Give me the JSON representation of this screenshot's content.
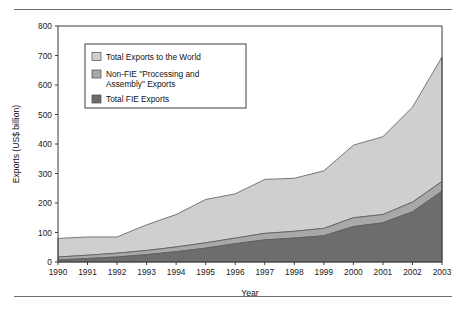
{
  "figure": {
    "top_rule": "horizontal-rule",
    "bottom_rule": "horizontal-rule"
  },
  "chart_data": {
    "type": "area",
    "stacked": true,
    "title": "",
    "xlabel": "Year",
    "ylabel": "Exports (US$ billion)",
    "categories": [
      "1990",
      "1991",
      "1992",
      "1993",
      "1994",
      "1995",
      "1996",
      "1997",
      "1998",
      "1999",
      "2000",
      "2001",
      "2002",
      "2003"
    ],
    "x": [
      1990,
      1991,
      1992,
      1993,
      1994,
      1995,
      1996,
      1997,
      1998,
      1999,
      2000,
      2001,
      2002,
      2003
    ],
    "xlim": [
      1990,
      2003
    ],
    "ylim": [
      0,
      800
    ],
    "yticks": [
      0,
      100,
      200,
      300,
      400,
      500,
      600,
      700,
      800
    ],
    "ytick_labels": [
      "0",
      "100",
      "200",
      "300",
      "400",
      "500",
      "600",
      "700",
      "800"
    ],
    "grid": false,
    "legend_position": "upper-left-inside",
    "series": [
      {
        "name": "Total FIE Exports",
        "color": "#6d6d6d",
        "stack_order": 1,
        "values": [
          7,
          12,
          17,
          25,
          35,
          47,
          62,
          75,
          81,
          89,
          120,
          133,
          170,
          240
        ]
      },
      {
        "name": "Non-FIE \"Processing and Assembly\" Exports",
        "color": "#a8a8a8",
        "stack_order": 2,
        "values": [
          10,
          11,
          13,
          14,
          16,
          18,
          19,
          22,
          23,
          25,
          30,
          28,
          33,
          33
        ]
      },
      {
        "name": "Total Exports to the World",
        "color": "#cfcfcf",
        "stack_order": 3,
        "values": [
          63,
          62,
          55,
          87,
          110,
          147,
          150,
          183,
          180,
          195,
          246,
          264,
          322,
          422
        ]
      }
    ],
    "cumulative_totals": {
      "Total FIE Exports": [
        7,
        12,
        17,
        25,
        35,
        47,
        62,
        75,
        81,
        89,
        120,
        133,
        170,
        240
      ],
      "FIE + Non-FIE Processing and Assembly": [
        17,
        23,
        30,
        39,
        51,
        65,
        81,
        97,
        104,
        114,
        150,
        161,
        203,
        273
      ],
      "Total Exports to the World": [
        80,
        85,
        85,
        126,
        161,
        212,
        231,
        280,
        284,
        309,
        396,
        425,
        525,
        695
      ]
    },
    "legend_entries": [
      {
        "label": "Total Exports to the World",
        "color": "#cfcfcf"
      },
      {
        "label": "Non-FIE \"Processing and",
        "label2": "Assembly\" Exports",
        "color": "#a8a8a8"
      },
      {
        "label": "Total FIE Exports",
        "color": "#6d6d6d"
      }
    ]
  }
}
